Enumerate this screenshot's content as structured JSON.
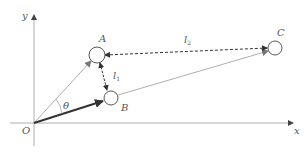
{
  "diagram": {
    "axes": {
      "x_label": "x",
      "y_label": "y",
      "origin_label": "O"
    },
    "nodes": [
      {
        "id": "A",
        "label": "A",
        "cx": 97,
        "cy": 55,
        "r": 8
      },
      {
        "id": "B",
        "label": "B",
        "cx": 111,
        "cy": 98,
        "r": 7
      },
      {
        "id": "C",
        "label": "C",
        "cx": 275,
        "cy": 48,
        "r": 7
      }
    ],
    "edges": [
      {
        "from": "O",
        "to": "A",
        "style": "solid-thin",
        "arrow": true
      },
      {
        "from": "O",
        "to": "B",
        "style": "solid-bold",
        "arrow": true
      },
      {
        "from": "B",
        "to": "C",
        "style": "solid-thin",
        "arrow": true
      },
      {
        "from": "A",
        "to": "B",
        "style": "dashed",
        "arrow": "both",
        "label": "l1"
      },
      {
        "from": "A",
        "to": "C",
        "style": "dashed",
        "arrow": "both",
        "label": "l2"
      }
    ],
    "labels": {
      "y": "y",
      "x": "x",
      "O": "O",
      "A": "A",
      "B": "B",
      "C": "C",
      "theta": "θ",
      "l1_main": "l",
      "l1_sub": "1",
      "l2_main": "l",
      "l2_sub": "2"
    },
    "colors": {
      "axis": "#888888",
      "thin": "#999999",
      "bold": "#333333",
      "dashed": "#333333",
      "circle": "#444444"
    }
  }
}
